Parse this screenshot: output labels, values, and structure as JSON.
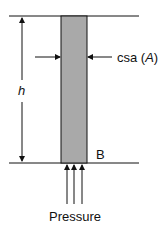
{
  "diagram": {
    "labels": {
      "height": "h",
      "csa_prefix": "csa (",
      "csa_var": "A",
      "csa_suffix": ")",
      "base_point": "B",
      "pressure": "Pressure"
    },
    "colors": {
      "column_fill": "#a9a9a9",
      "line": "#111111"
    }
  }
}
